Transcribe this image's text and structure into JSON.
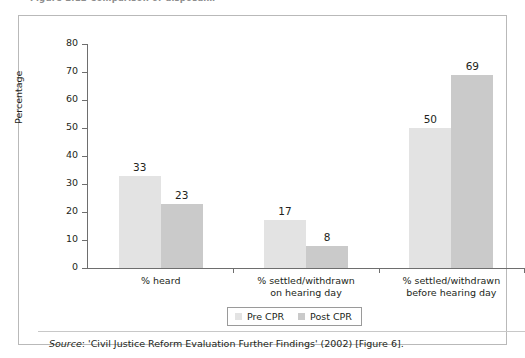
{
  "figure": {
    "caption_clipped": "Figure 2.12   Comparison of disposal…",
    "source_lead": "Source",
    "source_text": ": 'Civil Justice Reform Evaluation Further Findings' (2002) [Figure 6]."
  },
  "colors": {
    "series_pre": "#e3e3e3",
    "series_post": "#cacaca",
    "axis": "#6e6e6e",
    "frame": "#b9b9b9",
    "text": "#231f20"
  },
  "chart_data": {
    "type": "bar",
    "title": "",
    "xlabel": "",
    "ylabel": "Percentage",
    "ylim": [
      0,
      80
    ],
    "yticks": [
      0,
      10,
      20,
      30,
      40,
      50,
      60,
      70,
      80
    ],
    "ytick_labels": [
      "0",
      "10",
      "20",
      "30",
      "40",
      "50",
      "60",
      "70",
      "80"
    ],
    "grid": false,
    "legend_position": "bottom-center",
    "categories": [
      "% heard",
      "% settled/withdrawn\non hearing day",
      "% settled/withdrawn\nbefore hearing day"
    ],
    "category_lines": [
      [
        "% heard"
      ],
      [
        "% settled/withdrawn",
        "on hearing day"
      ],
      [
        "% settled/withdrawn",
        "before hearing day"
      ]
    ],
    "series": [
      {
        "name": "Pre CPR",
        "color": "#e3e3e3",
        "values": [
          33,
          17,
          50
        ]
      },
      {
        "name": "Post CPR",
        "color": "#cacaca",
        "values": [
          23,
          8,
          69
        ]
      }
    ],
    "data_labels": [
      [
        "33",
        "23"
      ],
      [
        "17",
        "8"
      ],
      [
        "50",
        "69"
      ]
    ]
  }
}
